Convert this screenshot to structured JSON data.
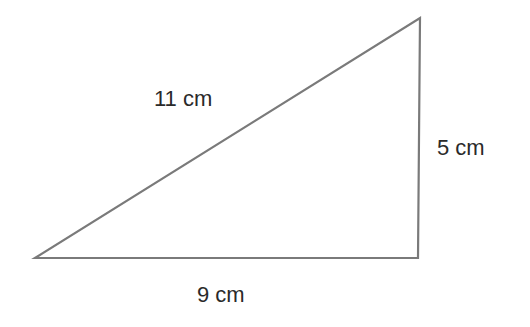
{
  "figure": {
    "shape": "right-triangle",
    "stroke_color": "#7a7a7a",
    "fill_color": "#ffffff",
    "vertices": [
      {
        "x": 35,
        "y": 258
      },
      {
        "x": 418,
        "y": 258
      },
      {
        "x": 420,
        "y": 18
      }
    ],
    "labels": {
      "hypotenuse": "11 cm",
      "vertical_side": "5 cm",
      "base": "9 cm"
    }
  }
}
